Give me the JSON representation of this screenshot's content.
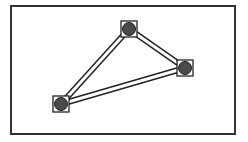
{
  "diagram": {
    "frame": {
      "x": 11,
      "y": 6,
      "width": 224,
      "height": 128,
      "stroke": "#333333"
    },
    "colors": {
      "line": "#222222",
      "node_fill": "#4a4a4a",
      "box_fill": "#ffffff"
    },
    "nodes": [
      {
        "id": "top",
        "x": 129,
        "y": 29
      },
      {
        "id": "right",
        "x": 185,
        "y": 68
      },
      {
        "id": "bottom-left",
        "x": 61,
        "y": 104
      }
    ],
    "edges": [
      {
        "from": "top",
        "to": "right"
      },
      {
        "from": "right",
        "to": "bottom-left"
      },
      {
        "from": "bottom-left",
        "to": "top"
      }
    ]
  }
}
